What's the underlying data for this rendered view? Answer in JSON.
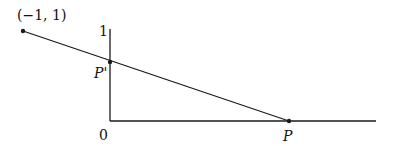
{
  "diagram": {
    "type": "geometry-projection",
    "labels": {
      "point_a": "(−1, 1)",
      "y_tick": "1",
      "origin": "0",
      "p_prime": "P'",
      "p": "P"
    },
    "points": {
      "a": {
        "x": 23,
        "y": 31
      },
      "p_prime": {
        "x": 110,
        "y": 62
      },
      "p": {
        "x": 289,
        "y": 121
      }
    },
    "axes": {
      "vertical": {
        "x": 110,
        "y1": 29,
        "y2": 121
      },
      "horizontal": {
        "y": 121,
        "x1": 110,
        "x2": 376
      }
    },
    "colors": {
      "line": "#1a1a1a",
      "text": "#111111"
    }
  }
}
